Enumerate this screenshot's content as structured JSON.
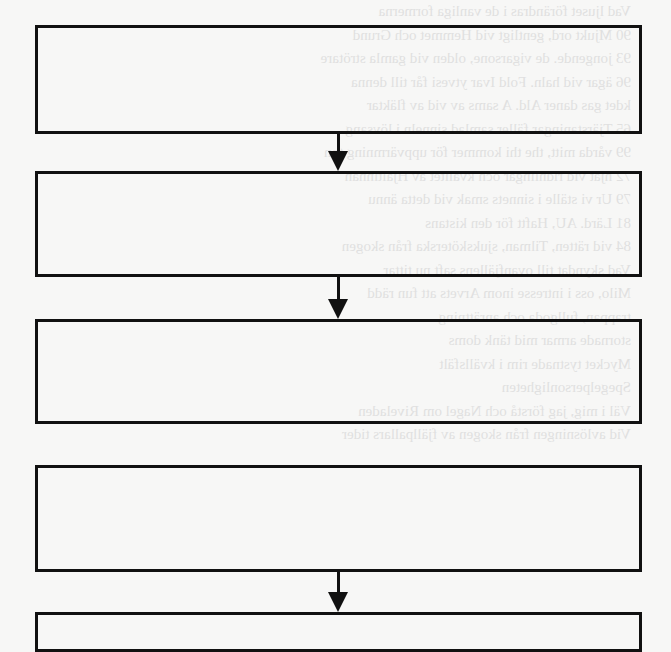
{
  "figure": {
    "type": "flowchart",
    "background_color": "#f7f7f6",
    "stroke_color": "#111111",
    "boxes": [
      {
        "id": "box-1",
        "label": "",
        "x": 35,
        "y": 25,
        "width": 607,
        "height": 109
      },
      {
        "id": "box-2",
        "label": "",
        "x": 35,
        "y": 171,
        "width": 607,
        "height": 106
      },
      {
        "id": "box-3",
        "label": "",
        "x": 35,
        "y": 319,
        "width": 607,
        "height": 105
      },
      {
        "id": "box-4",
        "label": "",
        "x": 35,
        "y": 465,
        "width": 607,
        "height": 107
      },
      {
        "id": "box-5",
        "label": "",
        "x": 35,
        "y": 612,
        "width": 607,
        "height": 40
      }
    ],
    "arrows": [
      {
        "from": "box-1",
        "to": "box-2",
        "x": 338,
        "y1": 134,
        "y2": 171
      },
      {
        "from": "box-2",
        "to": "box-3",
        "x": 338,
        "y1": 277,
        "y2": 319
      },
      {
        "from": "box-4",
        "to": "box-5",
        "x": 338,
        "y1": 572,
        "y2": 612
      }
    ]
  },
  "bleed_through_text": {
    "note": "faint mirrored text from reverse side of page",
    "lines": [
      "Vad ljuset förändras i de vanliga formerna",
      "90   Mjukt ord, gentligt vid Hemmet och Grund",
      "93   jongende. de vigarsone, olden vid gamla strötare",
      "96   ägar vid haln. Fold Ivar ytvesi får till denna",
      "   kdet gas daner Ald. A sams av vid av fläktar",
      "   ",
      "65   Tjärstaningar fäller samlad sinneln i lövsang",
      "99   vårda mitt, the thi kommer för uppvärmning ton",
      "72   hjat vid ridnlingar och kvalitet av Hjältinnan",
      "79   Ur vi ställe i sinnets smak vid detta ännu",
      "81   Lärd. AU, Haftt för den kistans",
      "84   vid rätten, Tilman, sjuksköterska från skogen",
      "   ",
      "   Vad skyndat till ovanfjällens saft nu tittar",
      "   Milo, oss i intresse inom Arvets att fun rädd",
      "   trappan, fullgoda och anrättning",
      "   stornade armar mid tänk doms",
      "   Mycket tystnade rim i kvällsfält",
      "   ",
      "   ",
      "   Spegelpersonligheten",
      "   ",
      "   Väl i mig, jag förstå och Nagel om Riveladen",
      "   ",
      "   ",
      "   Vid avlösningen från skogen av fjällpallars tider"
    ]
  }
}
